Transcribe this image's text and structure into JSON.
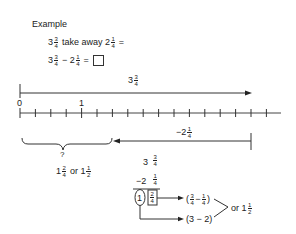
{
  "header": {
    "title": "Example"
  },
  "problem": {
    "line1": {
      "whole_a": "3",
      "num_a": "3",
      "den_a": "4",
      "text": "take away",
      "whole_b": "2",
      "num_b": "1",
      "den_b": "4",
      "equals": "="
    },
    "line2": {
      "whole_a": "3",
      "num_a": "3",
      "den_a": "4",
      "op": "−",
      "whole_b": "2",
      "num_b": "1",
      "den_b": "4",
      "equals": "="
    }
  },
  "number_line": {
    "labels": [
      {
        "value": "0"
      },
      {
        "value": "1"
      }
    ],
    "tick_step": "1/4",
    "top_arrow_label": {
      "whole": "3",
      "num": "3",
      "den": "4"
    },
    "back_arrow_label": {
      "whole": "−2",
      "num": "1",
      "den": "4"
    },
    "brace_label": "?"
  },
  "answer": {
    "whole1": "1",
    "num1": "2",
    "den1": "4",
    "or": "or",
    "whole2": "1",
    "num2": "1",
    "den2": "2"
  },
  "vertical_calc": {
    "row1": {
      "whole": "3",
      "num": "3",
      "den": "4"
    },
    "row2": {
      "whole": "−2",
      "num": "1",
      "den": "4"
    },
    "result_whole": "1",
    "result_num": "2",
    "result_den": "4",
    "frac_expr": {
      "open": "(",
      "n1": "3",
      "d1": "4",
      "op": "−",
      "n2": "1",
      "d2": "4",
      "close": ")"
    },
    "whole_expr": "(3 − 2)",
    "final": {
      "or": "or",
      "whole": "1",
      "num": "1",
      "den": "2"
    }
  }
}
